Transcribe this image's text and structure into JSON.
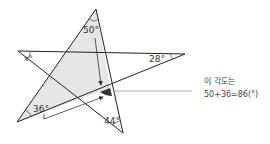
{
  "diagram": {
    "type": "pentagram-angle-sum",
    "angles": {
      "top": "50°",
      "left": "x°",
      "right": "28°",
      "bottom_left": "36°",
      "bottom_right": "44°"
    },
    "annotation": {
      "line1": "이 각도는",
      "line2": "50+36=86(°)"
    },
    "colors": {
      "line": "#222222",
      "shade": "#e6e6e6",
      "highlight_angle": "#333333",
      "pointer": "#999999"
    }
  }
}
